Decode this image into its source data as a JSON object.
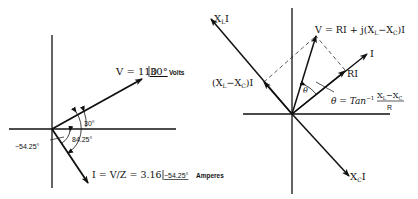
{
  "left_diagram": {
    "voltage_label": "V = 110",
    "voltage_angle": "30°",
    "voltage_unit": "Volts",
    "angle_v": "30°",
    "angle_between": "84.25°",
    "angle_i": "−54.25°",
    "current_label": "I = V/Z = 3.16",
    "current_angle": "−54.25°",
    "current_unit": "Amperes"
  },
  "right_diagram": {
    "xl_label": "X",
    "xl_sub": "L",
    "xl_suffix": "I",
    "v_label_prefix": "V = RI + j(X",
    "v_sub1": "L",
    "v_mid": "−X",
    "v_sub2": "C",
    "v_suffix": ")I",
    "i_label": "I",
    "ri_label": "RI",
    "xlxc_prefix": "(X",
    "xlxc_sub1": "L",
    "xlxc_mid": "−X",
    "xlxc_sub2": "C",
    "xlxc_suffix": ")I",
    "theta_symbol": "θ",
    "theta_eq": "θ = Tan",
    "theta_exp": "−1",
    "frac_num_prefix": "X",
    "frac_num_sub1": "L",
    "frac_num_mid": "−X",
    "frac_num_sub2": "C",
    "frac_den": "R",
    "xc_label": "X",
    "xc_sub": "C",
    "xc_suffix": "I"
  }
}
